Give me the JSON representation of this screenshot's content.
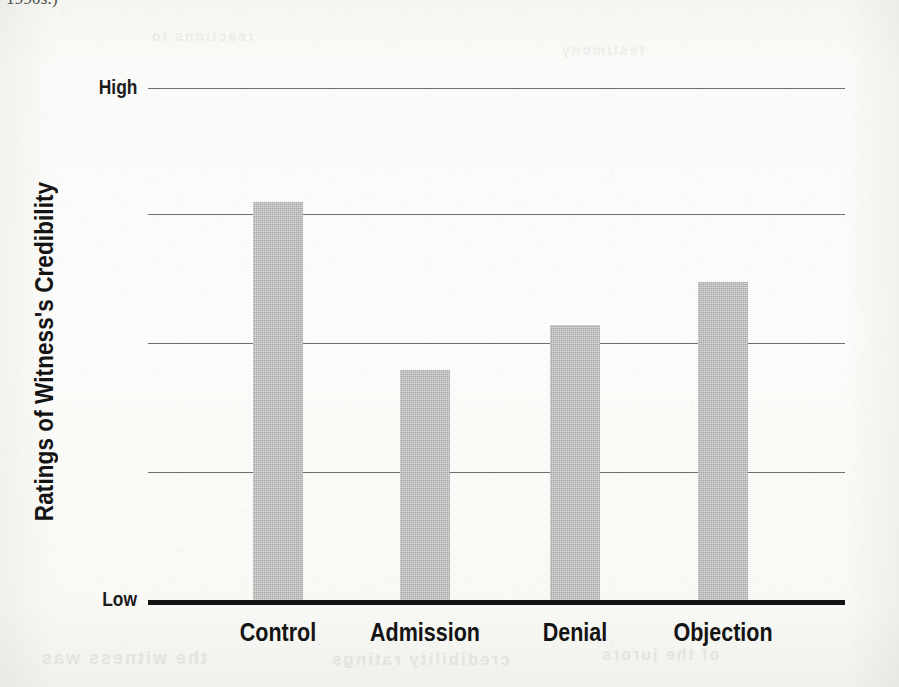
{
  "page": {
    "top_text_fragment": "1990s.)",
    "showthrough_artifacts": [
      "the witness was",
      "credibility ratings",
      "of the jurors",
      "reactions to",
      "testimony"
    ]
  },
  "chart_data": {
    "type": "bar",
    "title": "",
    "xlabel": "",
    "ylabel": "Ratings of Witness's Credibility",
    "categories": [
      "Control",
      "Admission",
      "Denial",
      "Objection"
    ],
    "values": [
      3.11,
      1.81,
      2.14,
      2.46
    ],
    "ylim": [
      0,
      4
    ],
    "y_axis_endpoints": {
      "low": "Low",
      "high": "High"
    },
    "grid": true,
    "gridline_count": 4,
    "legend": "none",
    "bar_color": "#b7b7b7",
    "axis_color": "#141414",
    "gridline_color": "#6e6e6e"
  },
  "geometry": {
    "plot_left": 148,
    "plot_right": 845,
    "baseline_y": 600,
    "high_y": 88,
    "gridlines_y": [
      88,
      214,
      343,
      472
    ],
    "bar_width": 50,
    "bars": [
      {
        "category": "Control",
        "x": 253,
        "top": 202,
        "center": 278
      },
      {
        "category": "Admission",
        "x": 400,
        "top": 370,
        "center": 425
      },
      {
        "category": "Denial",
        "x": 550,
        "top": 325,
        "center": 575
      },
      {
        "category": "Objection",
        "x": 698,
        "top": 282,
        "center": 723
      }
    ]
  }
}
